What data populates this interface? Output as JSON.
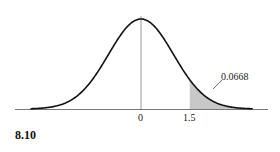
{
  "figure_label": "8.10",
  "chart_data": {
    "type": "area",
    "title": "",
    "xlabel": "",
    "ylabel": "",
    "tick_labels": [
      "0",
      "1.5"
    ],
    "x_ticks": [
      0,
      1.5
    ],
    "shaded_region": {
      "from": 1.5,
      "to": "inf",
      "area": 0.0668
    },
    "annotation": "0.0668",
    "xlim": [
      -3.5,
      3.5
    ],
    "grid": false,
    "legend": "none",
    "colors": {
      "curve": "#111111",
      "shade": "#c8c8c8",
      "axis": "#555555"
    }
  }
}
